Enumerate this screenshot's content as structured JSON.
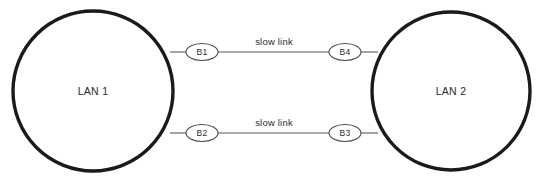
{
  "diagram": {
    "type": "network-topology",
    "title": "",
    "background_color": "#ffffff",
    "stroke_color": "#1a1a1a",
    "line_color": "#5a5a5a",
    "text_color": "#2b2b2b",
    "networks": [
      {
        "id": "lan1",
        "label": "LAN 1",
        "shape": "circle",
        "cx": 93,
        "cy": 91,
        "r": 80
      },
      {
        "id": "lan2",
        "label": "LAN 2",
        "shape": "circle",
        "cx": 451,
        "cy": 91,
        "r": 79
      }
    ],
    "bridges": [
      {
        "id": "b1",
        "label": "B1",
        "shape": "ellipse",
        "cx": 202,
        "cy": 52,
        "rx": 16,
        "ry": 8.5
      },
      {
        "id": "b4",
        "label": "B4",
        "shape": "ellipse",
        "cx": 345,
        "cy": 52,
        "rx": 16,
        "ry": 8.5
      },
      {
        "id": "b2",
        "label": "B2",
        "shape": "ellipse",
        "cx": 202,
        "cy": 133,
        "rx": 16,
        "ry": 8.5
      },
      {
        "id": "b3",
        "label": "B3",
        "shape": "ellipse",
        "cx": 345,
        "cy": 133,
        "rx": 16,
        "ry": 8.5
      }
    ],
    "links": [
      {
        "id": "link-top",
        "label": "slow link",
        "label_x": 274,
        "label_y": 45,
        "from": "b1",
        "to": "b4",
        "x1": 218,
        "y1": 52,
        "x2": 329,
        "y2": 52
      },
      {
        "id": "link-bottom",
        "label": "slow link",
        "label_x": 274,
        "label_y": 126,
        "from": "b2",
        "to": "b3",
        "x1": 218,
        "y1": 133,
        "x2": 329,
        "y2": 133
      }
    ],
    "stubs": [
      {
        "id": "stub-lan1-b1",
        "x1": 170,
        "y1": 52,
        "x2": 186,
        "y2": 52
      },
      {
        "id": "stub-lan1-b2",
        "x1": 170,
        "y1": 133,
        "x2": 186,
        "y2": 133
      },
      {
        "id": "stub-b4-lan2",
        "x1": 361,
        "y1": 52,
        "x2": 378,
        "y2": 52
      },
      {
        "id": "stub-b3-lan2",
        "x1": 361,
        "y1": 133,
        "x2": 378,
        "y2": 133
      }
    ]
  }
}
